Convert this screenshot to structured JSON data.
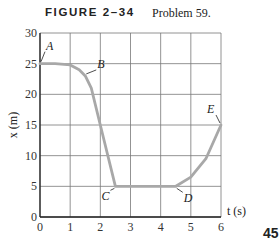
{
  "figure": {
    "label": "FIGURE 2–34",
    "caption": "Problem 59.",
    "page_number": "45"
  },
  "chart_data": {
    "type": "line",
    "xlabel": "t (s)",
    "ylabel": "x (m)",
    "xlim": [
      0,
      6
    ],
    "ylim": [
      0,
      30
    ],
    "x_ticks": [
      0,
      1,
      2,
      3,
      4,
      5,
      6
    ],
    "y_ticks": [
      0,
      5,
      10,
      15,
      20,
      25,
      30
    ],
    "grid": true,
    "series": [
      {
        "name": "position",
        "x": [
          0,
          0.5,
          1.0,
          1.3,
          1.5,
          1.7,
          2.0,
          2.5,
          3.0,
          3.5,
          4.0,
          4.5,
          5.0,
          5.5,
          6.0
        ],
        "values": [
          25,
          25,
          24.8,
          24,
          23,
          21,
          15,
          5,
          5,
          5,
          5,
          5,
          6.5,
          9.5,
          15
        ]
      }
    ],
    "annotations": [
      {
        "label": "A",
        "t": 0,
        "x": 25
      },
      {
        "label": "B",
        "t": 1.5,
        "x": 23
      },
      {
        "label": "C",
        "t": 2.5,
        "x": 5
      },
      {
        "label": "D",
        "t": 4.5,
        "x": 5
      },
      {
        "label": "E",
        "t": 6,
        "x": 15
      }
    ]
  }
}
